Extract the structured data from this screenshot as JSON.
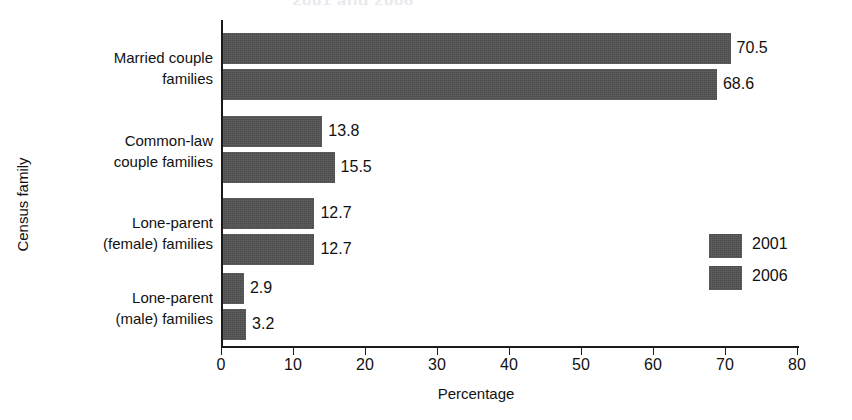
{
  "chart_data": {
    "type": "bar",
    "orientation": "horizontal",
    "title": "",
    "xlabel": "Percentage",
    "ylabel": "Census family",
    "xlim": [
      0,
      80
    ],
    "xticks": [
      0,
      10,
      20,
      30,
      40,
      50,
      60,
      70,
      80
    ],
    "grid": false,
    "legend_position": "middle-right",
    "categories": [
      "Married couple families",
      "Common-law couple families",
      "Lone-parent (female) families",
      "Lone-parent (male) families"
    ],
    "category_lines": [
      [
        "Married couple",
        "families"
      ],
      [
        "Common-law",
        "couple families"
      ],
      [
        "Lone-parent",
        "(female) families"
      ],
      [
        "Lone-parent",
        "(male) families"
      ]
    ],
    "series": [
      {
        "name": "2001",
        "values": [
          70.5,
          13.8,
          12.7,
          2.9
        ]
      },
      {
        "name": "2006",
        "values": [
          68.6,
          15.5,
          12.7,
          3.2
        ]
      }
    ],
    "value_labels": [
      [
        "70.5",
        "68.6"
      ],
      [
        "13.8",
        "15.5"
      ],
      [
        "12.7",
        "12.7"
      ],
      [
        "2.9",
        "3.2"
      ]
    ],
    "bar_color": "#4b4b4b"
  },
  "axis": {
    "tick_labels": [
      "0",
      "10",
      "20",
      "30",
      "40",
      "50",
      "60",
      "70",
      "80"
    ],
    "x_title": "Percentage",
    "y_title": "Census family"
  },
  "legend": {
    "items": [
      {
        "label": "2001",
        "color": "#4b4b4b"
      },
      {
        "label": "2006",
        "color": "#4b4b4b"
      }
    ]
  },
  "title_remnant": "2001 and 2006"
}
